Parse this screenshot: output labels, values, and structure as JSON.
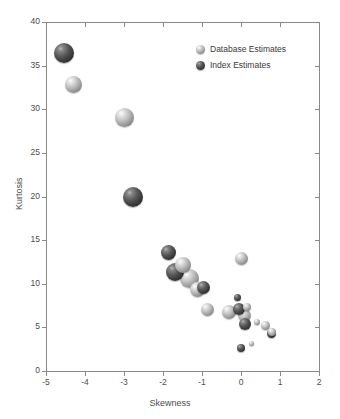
{
  "chart_data": {
    "type": "scatter",
    "title": "",
    "xlabel": "Skewness",
    "ylabel": "Kurtosis",
    "xlim": [
      -5,
      2
    ],
    "ylim": [
      0,
      40
    ],
    "xticks": [
      -5,
      -4,
      -3,
      -2,
      -1,
      0,
      1,
      2
    ],
    "yticks": [
      0,
      5,
      10,
      15,
      20,
      25,
      30,
      35,
      40
    ],
    "xticklabels": [
      "-5",
      "-4",
      "-3",
      "-2",
      "-1",
      "0",
      "1",
      "2"
    ],
    "yticklabels": [
      "0",
      "5",
      "10",
      "15",
      "20",
      "25",
      "30",
      "35",
      "40"
    ],
    "grid": false,
    "legend_position": "top-right",
    "marker_style": "3d-sphere",
    "series": [
      {
        "name": "Database Estimates",
        "color": "#b0b0b0",
        "points": [
          {
            "x": -4.3,
            "y": 32.8,
            "r": 8.5
          },
          {
            "x": -3.0,
            "y": 29.0,
            "r": 9.5
          },
          {
            "x": -1.48,
            "y": 12.1,
            "r": 8.0
          },
          {
            "x": -1.32,
            "y": 10.6,
            "r": 9.5
          },
          {
            "x": -1.12,
            "y": 9.3,
            "r": 7.5
          },
          {
            "x": -0.86,
            "y": 7.1,
            "r": 6.5
          },
          {
            "x": -0.3,
            "y": 6.8,
            "r": 7.0
          },
          {
            "x": 0.0,
            "y": 12.9,
            "r": 6.5
          },
          {
            "x": 0.1,
            "y": 6.4,
            "r": 6.5
          },
          {
            "x": 0.16,
            "y": 7.3,
            "r": 4.0
          },
          {
            "x": 0.26,
            "y": 3.1,
            "r": 2.5
          },
          {
            "x": 0.4,
            "y": 5.6,
            "r": 3.0
          },
          {
            "x": 0.62,
            "y": 5.2,
            "r": 4.5
          },
          {
            "x": 0.8,
            "y": 4.5,
            "r": 4.0
          }
        ]
      },
      {
        "name": "Index Estimates",
        "color": "#3a3a3a",
        "points": [
          {
            "x": -4.55,
            "y": 36.4,
            "r": 10.0
          },
          {
            "x": -2.77,
            "y": 20.0,
            "r": 10.0
          },
          {
            "x": -1.86,
            "y": 13.6,
            "r": 7.5
          },
          {
            "x": -1.68,
            "y": 11.3,
            "r": 9.0
          },
          {
            "x": -0.96,
            "y": 9.6,
            "r": 6.5
          },
          {
            "x": -0.08,
            "y": 8.4,
            "r": 3.5
          },
          {
            "x": -0.04,
            "y": 7.1,
            "r": 6.0
          },
          {
            "x": 0.1,
            "y": 5.4,
            "r": 6.0
          },
          {
            "x": 0.0,
            "y": 2.6,
            "r": 4.0
          },
          {
            "x": 0.78,
            "y": 4.3,
            "r": 4.5
          }
        ]
      }
    ]
  },
  "legend": {
    "items": [
      {
        "label": "Database Estimates",
        "swatch": "light-sphere-marker"
      },
      {
        "label": "Index Estimates",
        "swatch": "dark-sphere-marker"
      }
    ]
  }
}
